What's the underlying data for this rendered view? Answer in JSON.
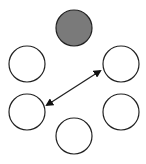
{
  "diagram": {
    "nodes": [
      {
        "id": "top",
        "cx": 74,
        "cy": 28,
        "r": 18,
        "fill": "#7a7a7a",
        "filled": true
      },
      {
        "id": "upper-left",
        "cx": 27,
        "cy": 64,
        "r": 18,
        "fill": "#ffffff",
        "filled": false
      },
      {
        "id": "upper-right",
        "cx": 121,
        "cy": 64,
        "r": 18,
        "fill": "#ffffff",
        "filled": false
      },
      {
        "id": "lower-left",
        "cx": 27,
        "cy": 112,
        "r": 18,
        "fill": "#ffffff",
        "filled": false
      },
      {
        "id": "lower-right",
        "cx": 121,
        "cy": 112,
        "r": 18,
        "fill": "#ffffff",
        "filled": false
      },
      {
        "id": "bottom",
        "cx": 74,
        "cy": 136,
        "r": 18,
        "fill": "#ffffff",
        "filled": false
      }
    ],
    "edges": [
      {
        "from": "lower-left",
        "to": "upper-right",
        "type": "double-arrow"
      }
    ],
    "stroke": "#222222"
  }
}
